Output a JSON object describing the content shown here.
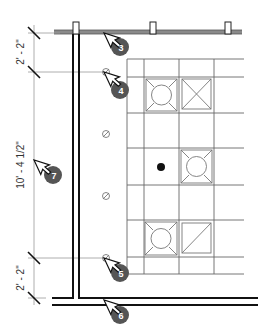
{
  "dimensions": {
    "top": "2' - 2\"",
    "middle": "10' - 4 1/2\"",
    "bottom": "2' - 2\""
  },
  "callouts": [
    {
      "number": "3",
      "x": 104,
      "y": 33,
      "badge_x": 120,
      "badge_y": 47
    },
    {
      "number": "4",
      "x": 104,
      "y": 72,
      "badge_x": 120,
      "badge_y": 90
    },
    {
      "number": "5",
      "x": 104,
      "y": 258,
      "badge_x": 120,
      "badge_y": 273
    },
    {
      "number": "6",
      "x": 104,
      "y": 300,
      "badge_x": 120,
      "badge_y": 315
    },
    {
      "number": "7",
      "x": 34,
      "y": 160,
      "badge_x": 53,
      "badge_y": 175
    }
  ],
  "colors": {
    "line": "#1a1a1a",
    "grid": "#666666",
    "light": "#999999",
    "badge": "#555555"
  }
}
